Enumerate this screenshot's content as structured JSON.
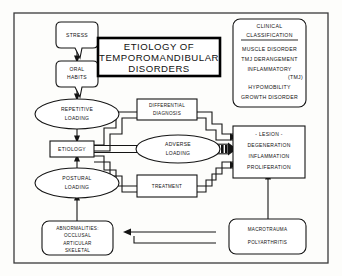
{
  "figure": {
    "title_box": {
      "lines": [
        "ETIOLOGY OF",
        "TEMPOROMANDIBULAR",
        "DISORDERS"
      ]
    },
    "clinical_classification": {
      "heading_lines": [
        "CLINICAL",
        "CLASSIFICATION"
      ],
      "items": [
        "MUSCLE DISORDER",
        "TMJ DERANGEMENT",
        "INFLAMMATORY",
        "HYPOMOBILITY",
        "GROWTH DISORDER"
      ],
      "inflammatory_qualifier": "(TMJ)"
    },
    "nodes": {
      "stress": "STRESS",
      "oral_habits_lines": [
        "ORAL",
        "HABITS"
      ],
      "repetitive_loading_lines": [
        "REPETITIVE",
        "LOADING"
      ],
      "etiology": "ETIOLOGY",
      "postural_loading_lines": [
        "POSTURAL",
        "LOADING"
      ],
      "differential_diagnosis_lines": [
        "DIFFERENTIAL",
        "DIAGNOSIS"
      ],
      "adverse_loading_lines": [
        "ADVERSE",
        "LOADING"
      ],
      "treatment": "TREATMENT",
      "lesion_lines": [
        "- LESION -",
        "DEGENERATION",
        "INFLAMMATION",
        "PROLIFERATION"
      ],
      "abnormalities_lines": [
        "ABNORMALITIES:",
        "OCCLUSAL",
        "ARTICULAR",
        "SKELETAL"
      ],
      "macrotrauma": "MACROTRAUMA",
      "polyarthritis": "POLYARTHRITIS"
    },
    "colors": {
      "ink": "#141414",
      "paper": "#fdfdfb",
      "frame": "#3a3a3a"
    }
  }
}
